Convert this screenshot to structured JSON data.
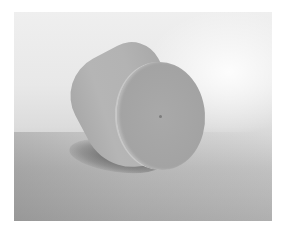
{
  "image": {
    "subject": "cylinder",
    "style": "grayscale photograph",
    "colors": {
      "border": "#ffffff",
      "background_light": "#efefef",
      "background_dark": "#a9a9a9",
      "cylinder_body": "#b3b3b3",
      "cylinder_face": "#a5a5a5",
      "shadow": "#3c3c3c"
    }
  }
}
